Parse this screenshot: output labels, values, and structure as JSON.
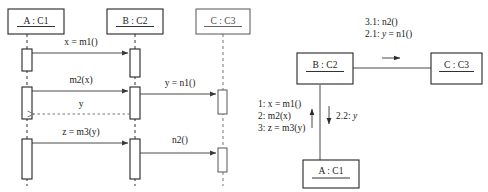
{
  "diagram": {
    "sequence": {
      "name": "sequence-diagram",
      "objects": [
        {
          "id": "a",
          "label": "A : C1"
        },
        {
          "id": "b",
          "label": "B : C2"
        },
        {
          "id": "c",
          "label": "C : C3"
        }
      ],
      "messages": [
        {
          "id": "m1",
          "label": "x = m1()",
          "kind": "call",
          "from": "a",
          "to": "b"
        },
        {
          "id": "m2",
          "label": "m2(x)",
          "kind": "call",
          "from": "a",
          "to": "b"
        },
        {
          "id": "n1",
          "label": "y = n1()",
          "kind": "call",
          "from": "b",
          "to": "c"
        },
        {
          "id": "ret_y",
          "label": "y",
          "kind": "return",
          "from": "b",
          "to": "a"
        },
        {
          "id": "m3",
          "label": "z = m3(y)",
          "kind": "call",
          "from": "a",
          "to": "b"
        },
        {
          "id": "n2",
          "label": "n2()",
          "kind": "call",
          "from": "b",
          "to": "c"
        }
      ]
    },
    "collaboration": {
      "name": "collaboration-diagram",
      "objects": [
        {
          "id": "b",
          "label": "B : C2"
        },
        {
          "id": "c",
          "label": "C : C3"
        },
        {
          "id": "a",
          "label": "A : C1"
        }
      ],
      "link_bc_messages": [
        {
          "label": "3.1: n2()"
        },
        {
          "label_prefix": "2.1: ",
          "label_italic": "y",
          "label_suffix": " = n1()"
        }
      ],
      "link_ab_up_messages": [
        {
          "label": "1: x = m1()"
        },
        {
          "label": "2: m2(x)"
        },
        {
          "label": "3: z = m3(y)"
        }
      ],
      "link_ab_down_messages": [
        {
          "label_prefix": "2.2: ",
          "label_italic": "y",
          "label_suffix": ""
        }
      ]
    },
    "colors": {
      "background": "#ffffff",
      "stroke": "#262626",
      "stroke_faint": "#555555",
      "line": "#4a4a4a",
      "text": "#1a1a1a"
    }
  }
}
